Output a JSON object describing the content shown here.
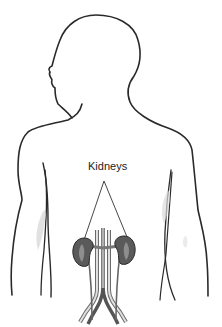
{
  "diagram": {
    "type": "anatomical-illustration",
    "labels": [
      {
        "text": "Kidneys",
        "points_to": [
          "left-kidney",
          "right-kidney"
        ]
      }
    ],
    "colors": {
      "background": "#ffffff",
      "outline": "#2a2a2a",
      "kidney_fill": "#5a5a5a",
      "vessel": "#888888",
      "shading": "#cccccc"
    }
  }
}
